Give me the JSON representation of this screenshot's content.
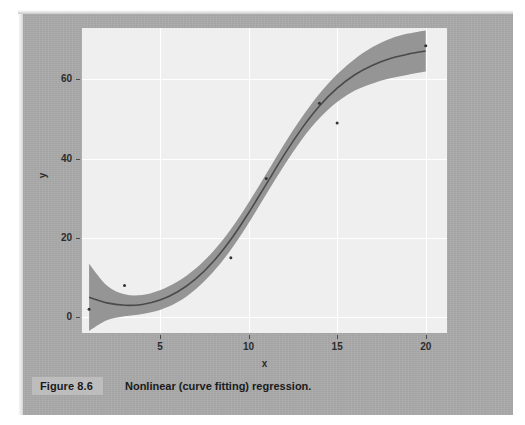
{
  "figure": {
    "number_label": "Figure 8.6",
    "caption": "Nonlinear (curve fitting) regression."
  },
  "colors": {
    "page_background": "#a9a9a9",
    "plot_background": "#efefef",
    "gridline": "#ffffff",
    "band_fill": "#8f8f8f",
    "fit_line": "#4a4a4a",
    "point": "#333333",
    "caption_box": "#bdbdbd"
  },
  "chart_data": {
    "type": "line",
    "title": "",
    "xlabel": "x",
    "ylabel": "y",
    "xlim": [
      0.6,
      21.2
    ],
    "ylim": [
      -4,
      73
    ],
    "xticks": [
      5,
      10,
      15,
      20
    ],
    "yticks": [
      0,
      20,
      40,
      60
    ],
    "xtick_labels": [
      "5",
      "10",
      "15",
      "20"
    ],
    "ytick_labels": [
      "0",
      "20",
      "40",
      "60"
    ],
    "grid": true,
    "legend": "none",
    "series": [
      {
        "name": "fitted curve",
        "kind": "line",
        "x": [
          1,
          2,
          3,
          4,
          5,
          6,
          7,
          8,
          9,
          10,
          11,
          12,
          13,
          14,
          15,
          16,
          17,
          18,
          19,
          20
        ],
        "y": [
          5.0,
          3.6,
          3.0,
          3.2,
          4.3,
          6.4,
          9.6,
          14.0,
          19.6,
          26.3,
          33.6,
          40.9,
          47.6,
          53.3,
          57.8,
          61.2,
          63.6,
          65.3,
          66.4,
          67.2
        ]
      },
      {
        "name": "confidence band upper",
        "kind": "band",
        "x": [
          1,
          2,
          3,
          4,
          5,
          6,
          7,
          8,
          9,
          10,
          11,
          12,
          13,
          14,
          15,
          16,
          17,
          18,
          19,
          20
        ],
        "y": [
          13.5,
          8.0,
          5.8,
          5.6,
          6.8,
          9.0,
          12.2,
          16.6,
          22.2,
          28.9,
          36.2,
          43.6,
          50.4,
          56.4,
          61.3,
          65.2,
          68.2,
          70.3,
          71.6,
          72.4
        ]
      },
      {
        "name": "confidence band lower",
        "kind": "band",
        "x": [
          1,
          2,
          3,
          4,
          5,
          6,
          7,
          8,
          9,
          10,
          11,
          12,
          13,
          14,
          15,
          16,
          17,
          18,
          19,
          20
        ],
        "y": [
          -3.5,
          -0.8,
          0.2,
          0.8,
          1.8,
          3.8,
          7.0,
          11.4,
          17.0,
          23.7,
          31.0,
          38.2,
          44.8,
          50.2,
          54.3,
          57.2,
          59.0,
          60.3,
          61.2,
          62.0
        ]
      },
      {
        "name": "observations",
        "kind": "scatter",
        "points": [
          {
            "x": 1.0,
            "y": 2.0
          },
          {
            "x": 3.0,
            "y": 8.0
          },
          {
            "x": 9.0,
            "y": 15.0
          },
          {
            "x": 11.0,
            "y": 35.0
          },
          {
            "x": 14.0,
            "y": 54.0
          },
          {
            "x": 15.0,
            "y": 49.0
          },
          {
            "x": 20.0,
            "y": 68.5
          }
        ]
      }
    ]
  }
}
